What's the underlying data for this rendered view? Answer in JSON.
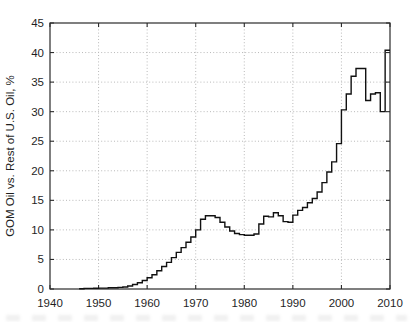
{
  "figure": {
    "background": "#ffffff",
    "width_px": 413,
    "height_px": 322
  },
  "colors": {
    "axis": "#2b2b2b",
    "grid": "#b9b9b9",
    "line": "#111111",
    "text": "#1f1f1f"
  },
  "chart_data": {
    "type": "line",
    "line_style": "step-post",
    "title": "",
    "xlabel": "",
    "ylabel": "GOM Oil vs. Rest of U.S. Oil, %",
    "xlim": [
      1940,
      2010
    ],
    "ylim": [
      0,
      45
    ],
    "xticks": [
      1940,
      1950,
      1960,
      1970,
      1980,
      1990,
      2000,
      2010
    ],
    "yticks": [
      0,
      5,
      10,
      15,
      20,
      25,
      30,
      35,
      40,
      45
    ],
    "grid": "dotted",
    "legend": "none",
    "series": [
      {
        "name": "GOM oil vs rest of U.S. oil share",
        "x": [
          1946,
          1947,
          1948,
          1949,
          1950,
          1951,
          1952,
          1953,
          1954,
          1955,
          1956,
          1957,
          1958,
          1959,
          1960,
          1961,
          1962,
          1963,
          1964,
          1965,
          1966,
          1967,
          1968,
          1969,
          1970,
          1971,
          1972,
          1973,
          1974,
          1975,
          1976,
          1977,
          1978,
          1979,
          1980,
          1981,
          1982,
          1983,
          1984,
          1985,
          1986,
          1987,
          1988,
          1989,
          1990,
          1991,
          1992,
          1993,
          1994,
          1995,
          1996,
          1997,
          1998,
          1999,
          2000,
          2001,
          2002,
          2003,
          2004,
          2005,
          2006,
          2007,
          2008,
          2009
        ],
        "values": [
          0.05,
          0.1,
          0.1,
          0.12,
          0.15,
          0.15,
          0.2,
          0.22,
          0.28,
          0.35,
          0.5,
          0.75,
          1.05,
          1.45,
          1.9,
          2.4,
          3.1,
          3.8,
          4.5,
          5.3,
          6.2,
          7.0,
          7.9,
          8.8,
          10.0,
          11.8,
          12.4,
          12.4,
          12.1,
          11.3,
          10.5,
          9.8,
          9.4,
          9.2,
          9.1,
          9.1,
          9.3,
          11.0,
          12.3,
          12.2,
          12.9,
          12.4,
          11.4,
          11.3,
          12.5,
          13.3,
          13.8,
          14.6,
          15.3,
          16.4,
          18.0,
          19.8,
          21.5,
          24.6,
          30.3,
          33.0,
          36.0,
          37.3,
          37.3,
          31.9,
          33.0,
          33.2,
          30.0,
          40.4
        ]
      }
    ]
  }
}
